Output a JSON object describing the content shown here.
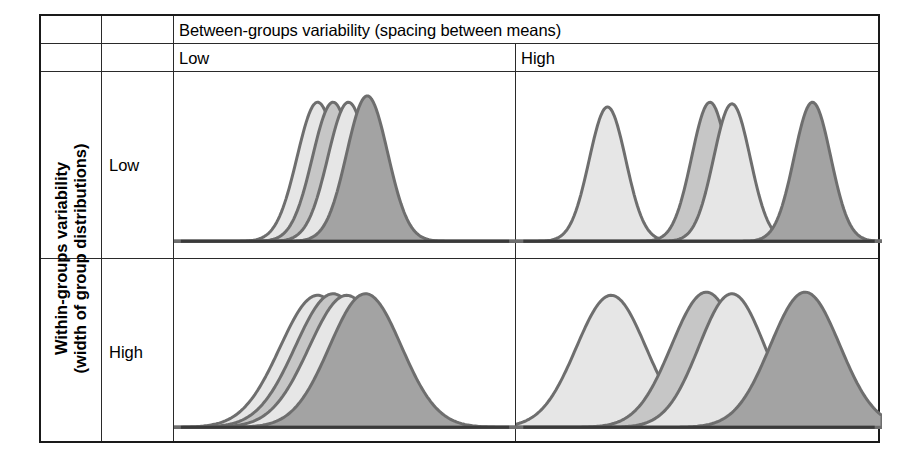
{
  "header": {
    "title": "Between-groups variability (spacing between means)",
    "columns": [
      {
        "label": "Low"
      },
      {
        "label": "High"
      }
    ]
  },
  "side": {
    "line1": "Within-groups variability",
    "line2": "(width of group distributions)",
    "rows": [
      {
        "label": "Low"
      },
      {
        "label": "High"
      }
    ]
  },
  "colors": {
    "fill_light": "#e6e6e6",
    "fill_medium": "#c6c6c6",
    "fill_dark": "#a3a3a3",
    "stroke": "#6e6e6e",
    "baseline": "#3a3a3a",
    "grid": "#2a2a2a",
    "text": "#000000"
  },
  "chart_data": {
    "type": "line",
    "title": "Between-groups variability (spacing between means)",
    "xlabel": "",
    "ylabel": "",
    "grid": false,
    "legend": "none",
    "row_factor": "Within-groups variability (width of group distributions)",
    "col_factor": "Between-groups variability (spacing between means)",
    "row_levels": [
      "Low",
      "High"
    ],
    "col_levels": [
      "Low",
      "High"
    ],
    "xlim": [
      0,
      100
    ],
    "ylim": [
      0,
      100
    ],
    "panels": [
      {
        "row": "Low",
        "col": "Low",
        "within_sd": 6.0,
        "between_spacing": 4.5,
        "curves": [
          {
            "shade": "light",
            "mean": 42.0,
            "sd": 6.0,
            "peak": 88
          },
          {
            "shade": "medium",
            "mean": 46.5,
            "sd": 6.0,
            "peak": 88
          },
          {
            "shade": "light",
            "mean": 51.0,
            "sd": 6.0,
            "peak": 88
          },
          {
            "shade": "dark",
            "mean": 56.5,
            "sd": 6.0,
            "peak": 92
          }
        ]
      },
      {
        "row": "Low",
        "col": "High",
        "within_sd": 5.0,
        "between_spacing": 21.0,
        "curves": [
          {
            "shade": "light",
            "mean": 25.0,
            "sd": 5.0,
            "peak": 85
          },
          {
            "shade": "medium",
            "mean": 53.0,
            "sd": 5.0,
            "peak": 88
          },
          {
            "shade": "light",
            "mean": 59.0,
            "sd": 5.0,
            "peak": 87
          },
          {
            "shade": "dark",
            "mean": 81.0,
            "sd": 5.0,
            "peak": 88
          }
        ]
      },
      {
        "row": "High",
        "col": "Low",
        "within_sd": 11.0,
        "between_spacing": 4.5,
        "curves": [
          {
            "shade": "light",
            "mean": 42.0,
            "sd": 11.0,
            "peak": 84
          },
          {
            "shade": "medium",
            "mean": 46.5,
            "sd": 11.0,
            "peak": 85
          },
          {
            "shade": "light",
            "mean": 50.5,
            "sd": 11.0,
            "peak": 84
          },
          {
            "shade": "dark",
            "mean": 56.0,
            "sd": 10.5,
            "peak": 85
          }
        ]
      },
      {
        "row": "High",
        "col": "High",
        "within_sd": 9.5,
        "between_spacing": 21.0,
        "curves": [
          {
            "shade": "light",
            "mean": 26.0,
            "sd": 9.5,
            "peak": 84
          },
          {
            "shade": "medium",
            "mean": 52.0,
            "sd": 9.5,
            "peak": 86
          },
          {
            "shade": "light",
            "mean": 59.0,
            "sd": 9.0,
            "peak": 85
          },
          {
            "shade": "dark",
            "mean": 79.0,
            "sd": 9.5,
            "peak": 86
          }
        ]
      }
    ]
  }
}
